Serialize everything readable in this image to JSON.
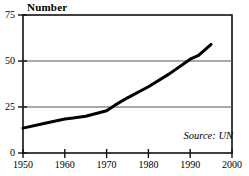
{
  "chart_data": {
    "type": "line",
    "title": "",
    "ylabel": "Number",
    "xlabel": "",
    "xlim": [
      1950,
      2000
    ],
    "ylim": [
      0,
      75
    ],
    "grid": true,
    "gridlines_y": [
      25,
      50
    ],
    "legend": "none",
    "annotation": "Source: UN",
    "y_ticks": [
      {
        "value": 0,
        "label": "0"
      },
      {
        "value": 25,
        "label": "25"
      },
      {
        "value": 50,
        "label": "50"
      },
      {
        "value": 75,
        "label": "75"
      }
    ],
    "x_ticks": [
      {
        "value": 1950,
        "label": "1950"
      },
      {
        "value": 1960,
        "label": "1960"
      },
      {
        "value": 1970,
        "label": "1970"
      },
      {
        "value": 1980,
        "label": "1980"
      },
      {
        "value": 1990,
        "label": "1990"
      },
      {
        "value": 2000,
        "label": "2000"
      }
    ],
    "series": [
      {
        "name": "Number",
        "color": "#000000",
        "x": [
          1950,
          1955,
          1960,
          1962,
          1965,
          1970,
          1972,
          1975,
          1980,
          1985,
          1990,
          1992,
          1995
        ],
        "values": [
          13.5,
          16,
          18.5,
          19,
          20,
          23,
          26,
          30,
          36,
          43,
          51,
          53,
          59
        ]
      }
    ]
  },
  "axis": {
    "y_title": "Number"
  },
  "note": {
    "source": "Source: UN"
  }
}
